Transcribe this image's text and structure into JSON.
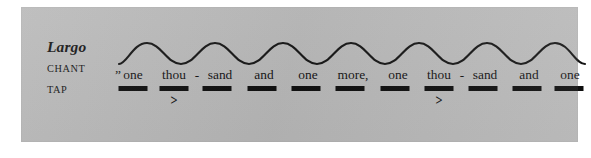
{
  "figure": {
    "background_color": "#b9b9b9",
    "page_color": "#ffffff",
    "ink_color": "#111111"
  },
  "labels": {
    "tempo": "Largo",
    "chant": "CHANT",
    "tap": "TAP"
  },
  "chant": {
    "full_text": "”one thou - sand and one more, one thou - sand and one more”",
    "open_quote": "”",
    "close_quote": "”",
    "syllables": [
      {
        "text": "one",
        "x": 16,
        "dash_x": 16,
        "dash_w": 29,
        "accent": ""
      },
      {
        "text": "thou",
        "x": 57,
        "dash_x": 57,
        "dash_w": 29,
        "accent": ">"
      },
      {
        "text": "-",
        "x": 80,
        "dash_x": null,
        "dash_w": 0,
        "accent": ""
      },
      {
        "text": "sand",
        "x": 103,
        "dash_x": 100,
        "dash_w": 29,
        "accent": ""
      },
      {
        "text": "and",
        "x": 147,
        "dash_x": 145,
        "dash_w": 29,
        "accent": ""
      },
      {
        "text": "one",
        "x": 191,
        "dash_x": 189,
        "dash_w": 29,
        "accent": ""
      },
      {
        "text": "more,",
        "x": 236,
        "dash_x": 233,
        "dash_w": 29,
        "accent": ""
      },
      {
        "text": "one",
        "x": 281,
        "dash_x": 278,
        "dash_w": 29,
        "accent": ""
      },
      {
        "text": "thou",
        "x": 322,
        "dash_x": 322,
        "dash_w": 29,
        "accent": ">"
      },
      {
        "text": "-",
        "x": 345,
        "dash_x": null,
        "dash_w": 0,
        "accent": ""
      },
      {
        "text": "sand",
        "x": 368,
        "dash_x": 366,
        "dash_w": 29,
        "accent": ""
      },
      {
        "text": "and",
        "x": 412,
        "dash_x": 410,
        "dash_w": 29,
        "accent": ""
      },
      {
        "text": "one",
        "x": 453,
        "dash_x": 452,
        "dash_w": 29,
        "accent": ""
      },
      {
        "text": "more",
        "x": 494,
        "dash_x": 494,
        "dash_w": 29,
        "accent": ""
      }
    ]
  },
  "tap": {
    "dash_count": 12,
    "accent_count": 2,
    "accent_symbol": ">"
  },
  "contour": {
    "shape": "sine-wave",
    "periods": 6,
    "path": "M 2,27 C 10,27 16,6 30,6 C 44,6 50,27 64,27 C 78,27 84,6 98,6 C 112,6 118,27 132,27 C 146,27 152,6 166,6 C 180,6 186,27 200,27 C 214,27 220,6 234,6 C 248,6 254,27 268,27 C 282,27 288,6 302,6 C 316,6 322,27 336,27 C 350,27 356,6 370,6 C 384,6 390,27 404,27 C 418,27 424,6 438,6 C 452,6 458,27 468,27"
  },
  "chart_data": {
    "type": "line",
    "title": "Largo",
    "xlabel": "",
    "ylabel": "",
    "series": [
      {
        "name": "pitch contour",
        "note": "smooth sine-wave intonation contour over the chant, 6 periods",
        "x": [
          0,
          1,
          2,
          3,
          4,
          5,
          6,
          7,
          8,
          9,
          10,
          11,
          12
        ],
        "values": [
          0,
          1,
          0,
          1,
          0,
          1,
          0,
          1,
          0,
          1,
          0,
          1,
          0
        ]
      },
      {
        "name": "tap pulse",
        "note": "one tap dash per chanted syllable; accents on the 2nd and 8th taps",
        "categories": [
          "one",
          "thou",
          "sand",
          "and",
          "one",
          "more",
          "one",
          "thou",
          "sand",
          "and",
          "one",
          "more"
        ],
        "values": [
          1,
          1,
          1,
          1,
          1,
          1,
          1,
          1,
          1,
          1,
          1,
          1
        ],
        "accents": [
          0,
          1,
          0,
          0,
          0,
          0,
          0,
          1,
          0,
          0,
          0,
          0
        ]
      }
    ],
    "legend_position": "left",
    "grid": false
  }
}
